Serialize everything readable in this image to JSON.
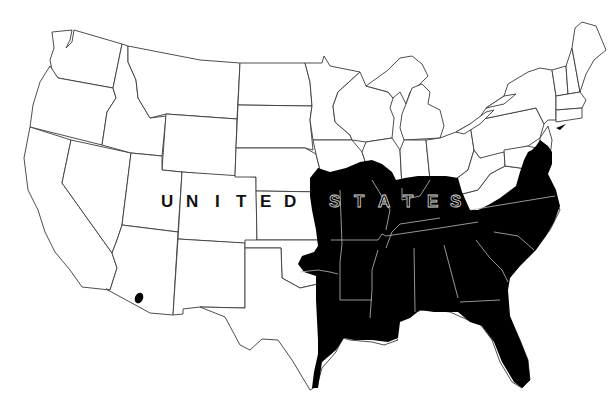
{
  "map": {
    "type": "species-range-map",
    "region": "United States (contiguous)",
    "label": {
      "words": [
        "UNITED",
        "STATES"
      ],
      "letters_united": [
        "U",
        "N",
        "I",
        "T",
        "E",
        "D"
      ],
      "letters_states": [
        "S",
        "T",
        "A",
        "T",
        "E",
        "S"
      ]
    },
    "colors": {
      "background": "#ffffff",
      "state_border": "#3a3a3a",
      "range_fill": "#000000",
      "border_within_range": "#bdbdbd"
    },
    "range_areas": [
      {
        "name": "southeastern-range",
        "description": "Black-filled range covering the southeastern United States from eastern Texas/Oklahoma/Kansas east to the Atlantic coast, north to Missouri, southern Illinois, Indiana, Kentucky, Virginia, Maryland, Delaware and southern New Jersey, south through Florida"
      },
      {
        "name": "arizona-disjunct-spot",
        "description": "Small isolated black spot in southern Arizona near the Mexico border"
      }
    ]
  }
}
